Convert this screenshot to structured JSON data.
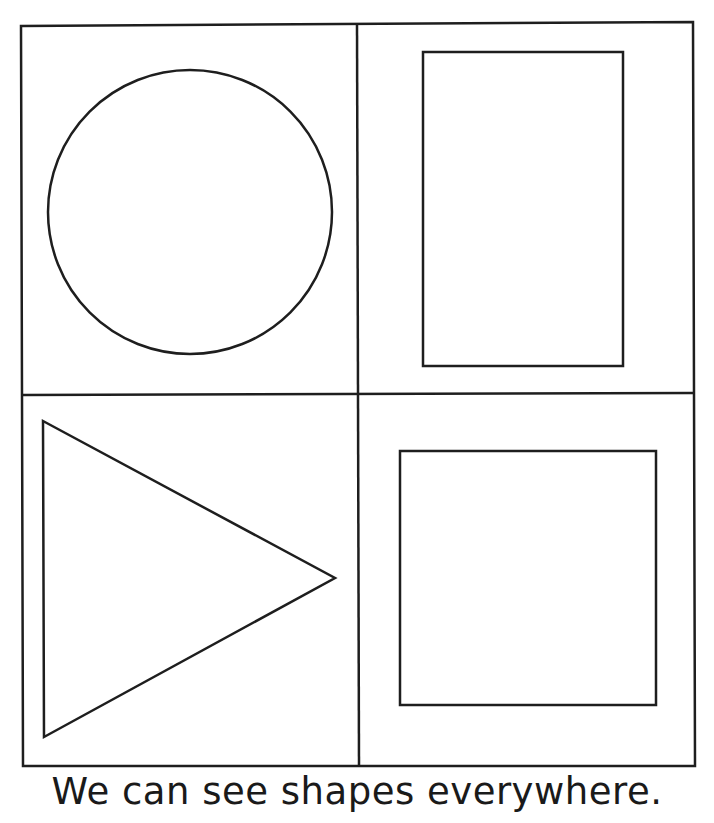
{
  "worksheet": {
    "caption": "We can see shapes everywhere.",
    "line_color": "#1e1e1e",
    "background": "#ffffff",
    "grid": {
      "rows": 2,
      "cols": 2,
      "cells": [
        {
          "position": "top-left",
          "shape": "circle"
        },
        {
          "position": "top-right",
          "shape": "rectangle"
        },
        {
          "position": "bottom-left",
          "shape": "triangle"
        },
        {
          "position": "bottom-right",
          "shape": "square"
        }
      ]
    }
  }
}
